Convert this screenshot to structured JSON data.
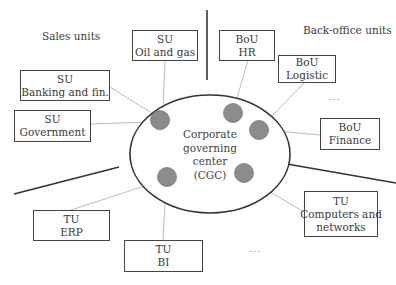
{
  "regions": {
    "sales": "Sales units",
    "back_office": "Back-office units"
  },
  "center": {
    "lines": [
      "Corporate",
      "governing",
      "center",
      "(CGC)"
    ]
  },
  "units": [
    {
      "id": "su-oil-gas",
      "type": "SU",
      "name": "Oil and gas"
    },
    {
      "id": "su-banking",
      "type": "SU",
      "name": "Banking and fin."
    },
    {
      "id": "su-government",
      "type": "SU",
      "name": "Government"
    },
    {
      "id": "bou-hr",
      "type": "BoU",
      "name": "HR"
    },
    {
      "id": "bou-logistic",
      "type": "BoU",
      "name": "Logistic"
    },
    {
      "id": "bou-finance",
      "type": "BoU",
      "name": "Finance"
    },
    {
      "id": "tu-erp",
      "type": "TU",
      "name": "ERP"
    },
    {
      "id": "tu-bi",
      "type": "TU",
      "name": "BI"
    },
    {
      "id": "tu-computers",
      "type": "TU",
      "name": "Computers and",
      "name2": "networks"
    }
  ],
  "ellipsis": [
    "...",
    "..."
  ],
  "colors": {
    "node_fill": "#8c8c8c",
    "connector": "#bdbdbd",
    "divider": "#333333"
  }
}
